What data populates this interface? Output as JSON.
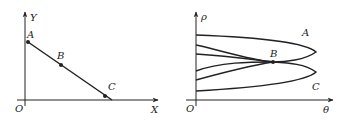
{
  "colors": {
    "stroke": "#222222",
    "background": "#ffffff"
  },
  "left_panel": {
    "origin_label": "O",
    "x_axis_label": "X",
    "y_axis_label": "Y",
    "points": [
      {
        "label": "A",
        "x": 28,
        "y": 42
      },
      {
        "label": "B",
        "x": 61,
        "y": 65
      },
      {
        "label": "C",
        "x": 105,
        "y": 96
      }
    ]
  },
  "right_panel": {
    "origin_label": "O",
    "x_axis_label": "θ",
    "y_axis_label": "ρ",
    "curve_labels": {
      "upper": "A",
      "intersection": "B",
      "lower": "C"
    }
  }
}
